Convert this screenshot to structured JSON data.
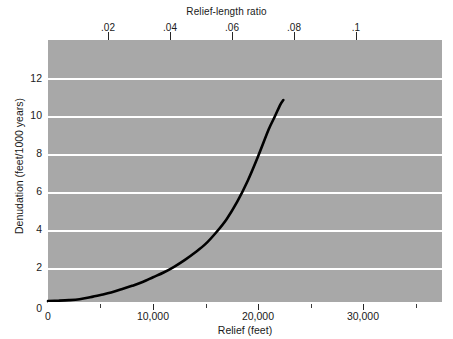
{
  "chart_data": {
    "type": "line",
    "title": "",
    "top_axis_label": "Relief-length ratio",
    "xlabel": "Relief (feet)",
    "ylabel": "Denudation (feet/1000 years)",
    "xlim": [
      0,
      37500
    ],
    "ylim": [
      0,
      13.8
    ],
    "top_xlim": [
      0,
      0.1206
    ],
    "grid": true,
    "gridlines_y": [
      2,
      4,
      6,
      8,
      10,
      12
    ],
    "legend": "none",
    "background_color": "#a8a8a8",
    "gridline_color": "#ffffff",
    "curve_color": "#000000",
    "xticks_major": [
      0,
      10000,
      20000,
      30000
    ],
    "xticklabels_major": [
      "0",
      "10,000",
      "20,000",
      "30,000"
    ],
    "xticks_minor": [
      5000,
      15000,
      25000,
      35000
    ],
    "yticks": [
      0,
      2,
      4,
      6,
      8,
      10,
      12
    ],
    "yticklabels": [
      "0",
      "2",
      "4",
      "6",
      "8",
      "10",
      "12"
    ],
    "top_ticks": [
      0.02,
      0.04,
      0.06,
      0.08,
      0.1
    ],
    "top_ticklabels": [
      ".02",
      ".04",
      ".06",
      ".08",
      ".1"
    ],
    "series": [
      {
        "name": "denudation-vs-relief",
        "x": [
          0,
          1000,
          2000,
          3000,
          4000,
          5000,
          6000,
          7000,
          8000,
          9000,
          10000,
          11000,
          12000,
          13000,
          14000,
          15000,
          16000,
          17000,
          18000,
          19000,
          20000,
          21000,
          21600,
          22100,
          22400
        ],
        "y": [
          0.1,
          0.12,
          0.15,
          0.2,
          0.3,
          0.42,
          0.55,
          0.72,
          0.9,
          1.1,
          1.35,
          1.6,
          1.9,
          2.25,
          2.65,
          3.1,
          3.7,
          4.4,
          5.3,
          6.4,
          7.7,
          9.1,
          9.8,
          10.4,
          10.65
        ]
      }
    ]
  },
  "axes": {
    "top_title": "Relief-length ratio",
    "bottom_title": "Relief (feet)",
    "left_title": "Denudation (feet/1000 years)",
    "top_ticklabels": [
      ".02",
      ".04",
      ".06",
      ".08",
      ".1"
    ],
    "bottom_ticklabels": [
      "0",
      "10,000",
      "20,000",
      "30,000"
    ],
    "left_ticklabels": [
      "12",
      "10",
      "8",
      "6",
      "4",
      "2",
      "0"
    ]
  }
}
